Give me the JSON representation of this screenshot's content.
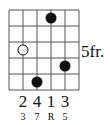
{
  "chord_diagram": {
    "strings": 6,
    "frets_shown": 5,
    "position_label": "5fr.",
    "position_fret_row": 3,
    "dots": [
      {
        "string": 4,
        "fret_row": 1,
        "style": "filled"
      },
      {
        "string": 2,
        "fret_row": 3,
        "style": "open"
      },
      {
        "string": 5,
        "fret_row": 4,
        "style": "filled"
      },
      {
        "string": 3,
        "fret_row": 5,
        "style": "filled"
      }
    ],
    "fingers": [
      {
        "string": 2,
        "label": "2"
      },
      {
        "string": 3,
        "label": "4"
      },
      {
        "string": 4,
        "label": "1"
      },
      {
        "string": 5,
        "label": "3"
      }
    ],
    "intervals": [
      {
        "string": 2,
        "label": "3"
      },
      {
        "string": 3,
        "label": "7"
      },
      {
        "string": 4,
        "label": "R"
      },
      {
        "string": 5,
        "label": "5"
      }
    ],
    "colors": {
      "line": "#555555",
      "dot": "#111111",
      "open_fill": "#ffffff"
    }
  }
}
